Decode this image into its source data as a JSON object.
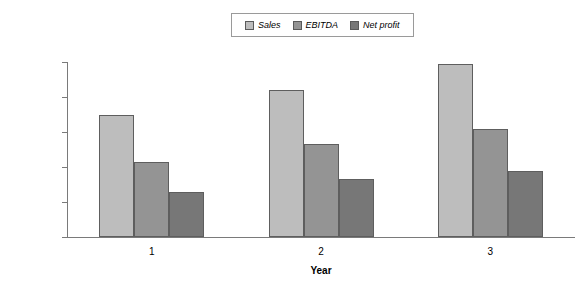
{
  "chart_data": {
    "type": "bar",
    "title": "",
    "xlabel": "Year",
    "ylabel": "",
    "categories": [
      "1",
      "2",
      "3"
    ],
    "series": [
      {
        "name": "Sales",
        "values": [
          3500000,
          4200000,
          4950000
        ],
        "color": "#bdbdbd"
      },
      {
        "name": "EBITDA",
        "values": [
          2150000,
          2650000,
          3100000
        ],
        "color": "#949494"
      },
      {
        "name": "Net profit",
        "values": [
          1300000,
          1650000,
          1900000
        ],
        "color": "#777777"
      }
    ],
    "ylim": [
      0,
      5000000
    ],
    "ytick_labels": [
      "$5,000,000",
      "$4,000,000",
      "$3,000,000",
      "$2,000,000",
      "$1,000,000",
      "$0"
    ],
    "ytick_values": [
      5000000,
      4000000,
      3000000,
      2000000,
      1000000,
      0
    ],
    "grid": false,
    "legend_position": "top-center"
  },
  "legend": {
    "entries": [
      {
        "label": "Sales"
      },
      {
        "label": "EBITDA"
      },
      {
        "label": "Net profit"
      }
    ]
  }
}
